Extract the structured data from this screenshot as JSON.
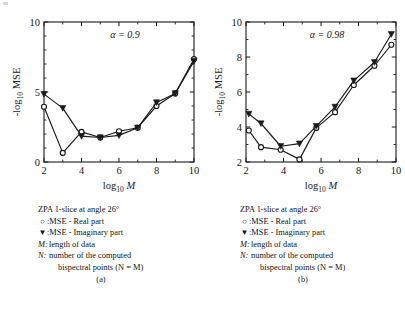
{
  "figure": {
    "background": "#ffffff",
    "ink": "#1a1a1a"
  },
  "legend_common": {
    "title": "ZPA 1-slice at angle 26°",
    "real_marker": "○",
    "real_text": ":MSE - Real part",
    "imag_marker": "▼",
    "imag_text": ":MSE - Imaginary part",
    "m_key": "M:",
    "m_text": "length of data",
    "n_key": "N:",
    "n_text": "number of the computed",
    "n_text2": "bispectral points (N = M)"
  },
  "panels": [
    {
      "label": "(a)"
    },
    {
      "label": "(b)"
    }
  ],
  "chart_data": [
    {
      "type": "line",
      "title": "",
      "annotation": "α = 0.9",
      "xlabel": "log10 M",
      "ylabel": "-log10 MSE",
      "xlim": [
        2,
        10
      ],
      "ylim": [
        0,
        10
      ],
      "xticks": [
        2,
        4,
        6,
        8,
        10
      ],
      "xticklabels": [
        "2",
        "4",
        "6",
        "8",
        "10"
      ],
      "xminorticks": [
        3,
        5,
        7,
        9
      ],
      "yticks": [
        0,
        5,
        10
      ],
      "yticklabels": [
        "0",
        "5",
        "10"
      ],
      "yminorticks": [
        1,
        2,
        3,
        4,
        6,
        7,
        8,
        9
      ],
      "grid": false,
      "legend_position": "below-figure",
      "series": [
        {
          "name": "MSE - Real part",
          "marker": "circle-open",
          "x": [
            2.0,
            3.0,
            4.0,
            5.0,
            6.0,
            7.0,
            8.0,
            9.0,
            10.0
          ],
          "values": [
            3.95,
            0.65,
            2.15,
            1.75,
            2.2,
            2.45,
            4.0,
            4.9,
            7.35
          ]
        },
        {
          "name": "MSE - Imaginary part",
          "marker": "triangle-down-filled",
          "x": [
            2.0,
            3.0,
            4.0,
            5.0,
            6.0,
            7.0,
            8.0,
            9.0,
            10.0
          ],
          "values": [
            4.85,
            3.85,
            1.85,
            1.75,
            1.9,
            2.45,
            4.25,
            4.9,
            7.2
          ]
        }
      ]
    },
    {
      "type": "line",
      "title": "",
      "annotation": "α = 0.98",
      "xlabel": "log10 M",
      "ylabel": "-log10 MSE",
      "xlim": [
        2,
        10
      ],
      "ylim": [
        2,
        10
      ],
      "xticks": [
        2,
        4,
        6,
        8,
        10
      ],
      "xticklabels": [
        "2",
        "4",
        "6",
        "8",
        "10"
      ],
      "xminorticks": [
        3,
        5,
        7,
        9
      ],
      "yticks": [
        2,
        4,
        6,
        8,
        10
      ],
      "yticklabels": [
        "2",
        "4",
        "6",
        "8",
        "10"
      ],
      "yminorticks": [
        3,
        5,
        7,
        9
      ],
      "grid": false,
      "legend_position": "below-figure",
      "series": [
        {
          "name": "MSE - Real part",
          "marker": "circle-open",
          "x": [
            2.15,
            2.8,
            3.85,
            4.85,
            5.75,
            6.75,
            7.75,
            8.85,
            9.75
          ],
          "values": [
            3.8,
            2.85,
            2.7,
            2.15,
            3.95,
            4.85,
            6.4,
            7.5,
            8.7
          ]
        },
        {
          "name": "MSE - Imaginary part",
          "marker": "triangle-down-filled",
          "x": [
            2.15,
            2.8,
            3.85,
            4.85,
            5.75,
            6.75,
            7.75,
            8.85,
            9.75
          ],
          "values": [
            4.75,
            4.2,
            2.9,
            3.05,
            4.05,
            5.15,
            6.65,
            7.7,
            9.3
          ]
        }
      ]
    }
  ]
}
